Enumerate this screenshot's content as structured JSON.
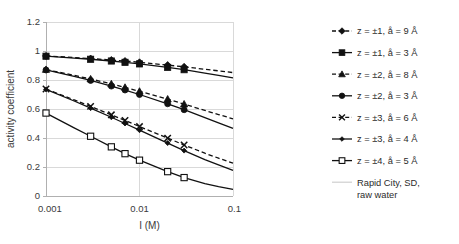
{
  "chart_data": {
    "type": "line",
    "title": "",
    "xlabel": "I (M)",
    "ylabel": "activity coefficient",
    "xscale": "log",
    "xlim": [
      0.001,
      0.1
    ],
    "ylim": [
      0,
      1.2
    ],
    "xticks": [
      "0.001",
      "0.01",
      "0.1"
    ],
    "xtick_values": [
      0.001,
      0.01,
      0.1
    ],
    "yticks": [
      "0",
      "0.2",
      "0.4",
      "0.6",
      "0.8",
      "1",
      "1.2"
    ],
    "ytick_values": [
      0,
      0.2,
      0.4,
      0.6,
      0.8,
      1.0,
      1.2
    ],
    "grid": true,
    "legend_position": "right",
    "annotation": "Rapid City, SD, raw water",
    "x": [
      0.001,
      0.002,
      0.003,
      0.005,
      0.007,
      0.01,
      0.02,
      0.03,
      0.05,
      0.07,
      0.1
    ],
    "series": [
      {
        "name": "z = ±1, å = 9 Å",
        "label": "z = ±1, å = 9 Å",
        "style": "dashed",
        "marker": "diamond",
        "marker_fill": "solid",
        "values": [
          0.966,
          0.955,
          0.948,
          0.938,
          0.931,
          0.922,
          0.903,
          0.891,
          0.874,
          0.863,
          0.851
        ]
      },
      {
        "name": "z = ±1, å = 3 Å",
        "label": "z = ±1, å = 3 Å",
        "style": "solid",
        "marker": "square",
        "marker_fill": "solid",
        "values": [
          0.964,
          0.951,
          0.943,
          0.931,
          0.922,
          0.911,
          0.887,
          0.871,
          0.848,
          0.832,
          0.814
        ]
      },
      {
        "name": "z = ±2, å = 8 Å",
        "label": "z = ±2, å = 8 Å",
        "style": "dashed",
        "marker": "triangle",
        "marker_fill": "solid",
        "values": [
          0.872,
          0.832,
          0.807,
          0.773,
          0.749,
          0.722,
          0.668,
          0.634,
          0.59,
          0.562,
          0.532
        ]
      },
      {
        "name": "z = ±2, å = 3 Å",
        "label": "z = ±2, å = 3 Å",
        "style": "solid",
        "marker": "circle",
        "marker_fill": "solid",
        "values": [
          0.869,
          0.825,
          0.797,
          0.758,
          0.731,
          0.7,
          0.636,
          0.595,
          0.54,
          0.505,
          0.466
        ]
      },
      {
        "name": "z = ±3, å = 6 Å",
        "label": "z = ±3, å = 6 Å",
        "style": "dashed",
        "marker": "cross",
        "marker_fill": "solid",
        "values": [
          0.738,
          0.663,
          0.618,
          0.56,
          0.521,
          0.479,
          0.399,
          0.352,
          0.295,
          0.261,
          0.226
        ]
      },
      {
        "name": "z = ±3, å = 4 Å",
        "label": "z = ±3, å = 4 Å",
        "style": "solid",
        "marker": "smalldiamond",
        "marker_fill": "solid",
        "values": [
          0.735,
          0.655,
          0.606,
          0.543,
          0.5,
          0.454,
          0.365,
          0.313,
          0.251,
          0.214,
          0.177
        ]
      },
      {
        "name": "z = ±4, å = 5 Å",
        "label": "z = ±4, å = 5 Å",
        "style": "solid",
        "marker": "square",
        "marker_fill": "open",
        "values": [
          0.572,
          0.47,
          0.412,
          0.339,
          0.292,
          0.247,
          0.168,
          0.127,
          0.085,
          0.064,
          0.046
        ]
      }
    ]
  },
  "colors": {
    "ink": "#111111",
    "grid": "#d9d9d9",
    "axis": "#b0b0b0",
    "tick_text": "#3a3a3a",
    "legend_text": "#2b2b2b",
    "background": "#ffffff"
  }
}
